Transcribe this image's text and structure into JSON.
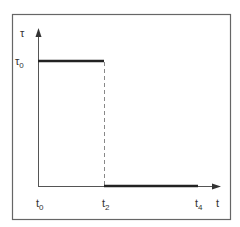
{
  "diagram": {
    "y_axis_label": "τ",
    "y_level_label": "τ",
    "y_level_sub": "0",
    "x_axis_label": "t",
    "x_ticks": [
      {
        "base": "t",
        "sub": "0"
      },
      {
        "base": "t",
        "sub": "2"
      },
      {
        "base": "t",
        "sub": "4"
      }
    ],
    "segments": [
      {
        "from": "t0",
        "to": "t2",
        "value": "τ0"
      },
      {
        "from": "t2",
        "to": "t4",
        "value": "0"
      }
    ]
  }
}
